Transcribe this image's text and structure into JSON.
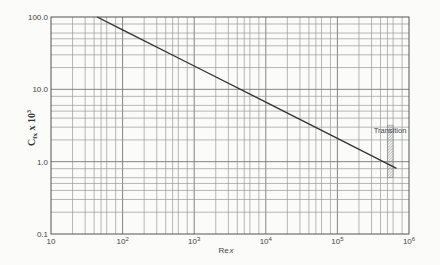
{
  "chart_data": {
    "type": "line",
    "title": "",
    "xlabel": "Re_x",
    "ylabel": "C_fx x 10^3",
    "xscale": "log",
    "yscale": "log",
    "xlim": [
      10,
      1000000
    ],
    "ylim": [
      0.1,
      100.0
    ],
    "x_tick_labels": [
      "10",
      "10^2",
      "10^3",
      "10^4",
      "10^5",
      "10^6"
    ],
    "y_tick_labels": [
      "0.1",
      "1.0",
      "10.0",
      "100.0"
    ],
    "grid": true,
    "series": [
      {
        "name": "Laminar skin friction (C_fx x 10^3 = 664/sqrt(Re_x))",
        "x": [
          44,
          100,
          1000,
          10000,
          100000,
          670000
        ],
        "y": [
          100.0,
          66.4,
          21.0,
          6.64,
          2.1,
          0.81
        ]
      }
    ],
    "annotations": [
      {
        "text": "Transition",
        "x_range": [
          500000,
          600000
        ],
        "y_range": [
          0.6,
          3.2
        ],
        "style": "hatched band"
      }
    ]
  },
  "axes": {
    "xlabel_main": "Re",
    "xlabel_sub": "x",
    "ylabel_main": "C",
    "ylabel_sub": "fx",
    "ylabel_mult": " x 10",
    "ylabel_exp": "3"
  },
  "annotation": {
    "transition_label": "Transition"
  }
}
